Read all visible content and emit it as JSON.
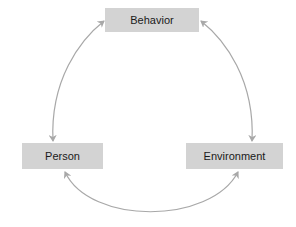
{
  "diagram": {
    "type": "triadic reciprocal cycle",
    "nodes": [
      {
        "id": "behavior",
        "label": "Behavior"
      },
      {
        "id": "person",
        "label": "Person"
      },
      {
        "id": "environment",
        "label": "Environment"
      }
    ],
    "edges": [
      {
        "from": "person",
        "to": "behavior",
        "direction": "bidirectional"
      },
      {
        "from": "behavior",
        "to": "environment",
        "direction": "bidirectional"
      },
      {
        "from": "person",
        "to": "environment",
        "direction": "bidirectional"
      }
    ],
    "colors": {
      "node_fill": "#d3d3d3",
      "arrow": "#a8a8a8",
      "text": "#1a1a1a"
    }
  }
}
